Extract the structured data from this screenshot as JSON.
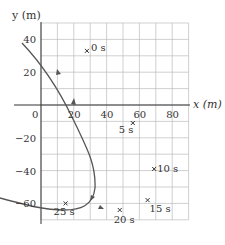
{
  "figure": {
    "x_label": "x (m)",
    "y_label": "y (m)",
    "x_ticks": [
      {
        "v": 0,
        "label": "0"
      },
      {
        "v": 20,
        "label": "20"
      },
      {
        "v": 40,
        "label": "40"
      },
      {
        "v": 60,
        "label": "60"
      },
      {
        "v": 80,
        "label": "80"
      }
    ],
    "y_ticks": [
      {
        "v": 40,
        "label": "40"
      },
      {
        "v": 20,
        "label": "20"
      },
      {
        "v": -20,
        "label": "−20"
      },
      {
        "v": -40,
        "label": "−40"
      },
      {
        "v": -60,
        "label": "−60"
      }
    ],
    "xlim": [
      0,
      90
    ],
    "ylim": [
      -70,
      50
    ],
    "grid_step": 10,
    "time_markers": [
      {
        "t": "0 s",
        "x": 28,
        "y": 33
      },
      {
        "t": "5 s",
        "x": 56,
        "y": -11
      },
      {
        "t": "10 s",
        "x": 69,
        "y": -39
      },
      {
        "t": "15 s",
        "x": 65,
        "y": -58
      },
      {
        "t": "20 s",
        "x": 48,
        "y": -64
      },
      {
        "t": "25 s",
        "x": 15,
        "y": -60
      }
    ],
    "curve_color": "#555555",
    "grid_color": "#bbbbbb"
  }
}
